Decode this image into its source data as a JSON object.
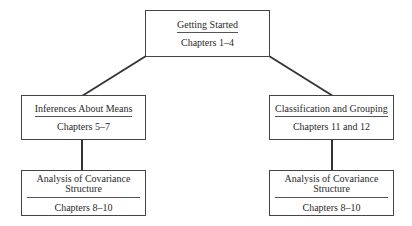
{
  "diagram": {
    "nodes": {
      "root": {
        "title": "Getting Started",
        "chapters": "Chapters 1–4"
      },
      "left_mid": {
        "title": "Inferences About Means",
        "chapters": "Chapters 5–7"
      },
      "right_mid": {
        "title": "Classification and Grouping",
        "chapters": "Chapters 11 and 12"
      },
      "left_bottom": {
        "title_line1": "Analysis of Covariance",
        "title_line2": "Structure",
        "chapters": "Chapters 8–10"
      },
      "right_bottom": {
        "title_line1": "Analysis of Covariance",
        "title_line2": "Structure",
        "chapters": "Chapters 8–10"
      }
    },
    "edges": [
      {
        "from": "root",
        "to": "left_mid"
      },
      {
        "from": "root",
        "to": "right_mid"
      },
      {
        "from": "left_mid",
        "to": "left_bottom"
      },
      {
        "from": "right_mid",
        "to": "right_bottom"
      }
    ],
    "colors": {
      "line": "#333333",
      "border": "#444444",
      "text": "#2a2a2a"
    }
  }
}
